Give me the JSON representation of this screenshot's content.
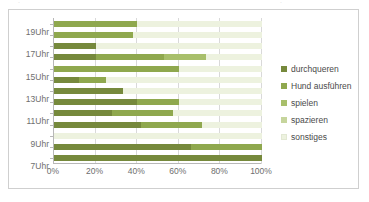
{
  "chart_data": {
    "type": "bar",
    "subtype": "stacked-horizontal-100percent",
    "title": "",
    "xlabel": "",
    "ylabel": "",
    "xlim": [
      0,
      100
    ],
    "xticks": [
      "0%",
      "20%",
      "40%",
      "60%",
      "80%",
      "100%"
    ],
    "xtick_values": [
      0,
      20,
      40,
      60,
      80,
      100
    ],
    "grid": true,
    "legend_position": "right",
    "categories": [
      "19Uhr",
      "18Uhr",
      "17Uhr",
      "16Uhr",
      "15Uhr",
      "14Uhr",
      "13Uhr",
      "12Uhr",
      "11Uhr",
      "10Uhr",
      "9Uhr",
      "8Uhr",
      "7Uhr"
    ],
    "category_labels_visible": [
      "19Uhr",
      "",
      "17Uhr",
      "",
      "15Uhr",
      "",
      "13Uhr",
      "",
      "11Uhr",
      "",
      "9Uhr",
      "",
      "7Uhr"
    ],
    "series": [
      {
        "name": "durchqueren",
        "color": "#76893C",
        "values": [
          0,
          0,
          20,
          20,
          0,
          12,
          33,
          40,
          28,
          42,
          0,
          66,
          100
        ]
      },
      {
        "name": "Hund ausführen",
        "color": "#8FA84E",
        "values": [
          40,
          38,
          0,
          33,
          60,
          13,
          0,
          20,
          29,
          29,
          0,
          34,
          0
        ]
      },
      {
        "name": "spielen",
        "color": "#A8BF6B",
        "values": [
          0,
          0,
          0,
          20,
          0,
          0,
          0,
          0,
          0,
          0,
          0,
          0,
          0
        ]
      },
      {
        "name": "spazieren",
        "color": "#C6D59C",
        "values": [
          0,
          0,
          0,
          0,
          0,
          0,
          0,
          0,
          0,
          0,
          0,
          0,
          0
        ]
      },
      {
        "name": "sonstiges",
        "color": "#EDF2DF",
        "values": [
          60,
          62,
          80,
          27,
          40,
          75,
          67,
          40,
          43,
          29,
          100,
          0,
          0
        ]
      }
    ]
  },
  "legend": {
    "items": [
      {
        "label": "durchqueren",
        "color": "#76893C"
      },
      {
        "label": "Hund ausführen",
        "color": "#8FA84E"
      },
      {
        "label": "spielen",
        "color": "#A8BF6B"
      },
      {
        "label": "spazieren",
        "color": "#C6D59C"
      },
      {
        "label": "sonstiges",
        "color": "#EDF2DF"
      }
    ]
  },
  "colors": {
    "border": "#cfcfcf",
    "gridline": "#d9d9d9",
    "axis": "#b8b8b8",
    "tick_text": "#6e6e6e",
    "legend_text": "#4a4a4a",
    "background": "#ffffff"
  }
}
